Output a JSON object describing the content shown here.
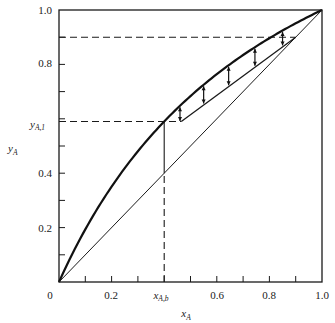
{
  "chart_data": {
    "type": "line",
    "title": "",
    "xlabel": "x_A",
    "ylabel": "y_A",
    "xlim": [
      0,
      1.0
    ],
    "ylim": [
      0,
      1.0
    ],
    "grid": false,
    "legend": null,
    "x_ticks": [
      0,
      0.1,
      0.2,
      0.3,
      0.4,
      0.5,
      0.6,
      0.7,
      0.8,
      0.9,
      1.0
    ],
    "x_tick_labels": [
      "0",
      "0.2",
      "x_A,b",
      "0.6",
      "0.8",
      "1.0"
    ],
    "y_ticks": [
      0,
      0.1,
      0.2,
      0.3,
      0.4,
      0.5,
      0.6,
      0.7,
      0.8,
      0.9,
      1.0
    ],
    "y_tick_labels": [
      "0.2",
      "0.4",
      "y_A,1",
      "0.8",
      "1.0"
    ],
    "series": [
      {
        "name": "equilibrium curve",
        "style": "thick solid",
        "relative_volatility": 2.16,
        "x": [
          0,
          0.1,
          0.2,
          0.3,
          0.4,
          0.5,
          0.6,
          0.7,
          0.8,
          0.9,
          1.0
        ],
        "y": [
          0,
          0.19,
          0.35,
          0.48,
          0.59,
          0.68,
          0.76,
          0.83,
          0.9,
          0.95,
          1.0
        ]
      },
      {
        "name": "diagonal y=x",
        "style": "thin solid",
        "x": [
          0,
          1.0
        ],
        "y": [
          0,
          1.0
        ]
      },
      {
        "name": "operating line",
        "style": "solid",
        "x": [
          0.465,
          0.9
        ],
        "y": [
          0.59,
          0.9
        ]
      }
    ],
    "guides": [
      {
        "type": "dashed-horizontal",
        "y": 0.9,
        "x_from": 0,
        "x_to": 0.9
      },
      {
        "type": "dashed-horizontal",
        "y": 0.59,
        "x_from": 0,
        "x_to": 0.465
      },
      {
        "type": "solid-vertical",
        "x": 0.4,
        "y_from": 0.4,
        "y_to": 0.59
      },
      {
        "type": "dashed-vertical",
        "x": 0.4,
        "y_from": 0,
        "y_to": 0.4
      }
    ],
    "driving_force_arrows_x": [
      0.46,
      0.55,
      0.645,
      0.745,
      0.85
    ],
    "annotations": {
      "y_A1": {
        "label": "y_A,1",
        "value": 0.59
      },
      "x_Ab": {
        "label": "x_A,b",
        "value": 0.4
      }
    }
  },
  "labels": {
    "x_axis": {
      "main": "x",
      "sub": "A"
    },
    "y_axis": {
      "main": "y",
      "sub": "A"
    },
    "y_A1": {
      "main": "y",
      "sub": "A,1"
    },
    "x_Ab": {
      "main": "x",
      "sub": "A,b"
    },
    "x_ticks": [
      "0",
      "0.2",
      "0.6",
      "0.8",
      "1.0"
    ],
    "y_ticks": [
      "0.2",
      "0.4",
      "0.8",
      "1.0"
    ]
  }
}
